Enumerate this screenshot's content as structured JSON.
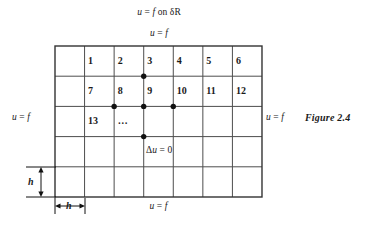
{
  "figure": {
    "caption": "Figure  2.4",
    "labels": {
      "top_outer": "u = f on δR",
      "top_inner": "u = f",
      "bottom": "u = f",
      "left": "u = f",
      "right": "u = f",
      "interior": "Δu = 0"
    },
    "dimensions": {
      "vertical_step": "h",
      "horizontal_step": "h"
    },
    "grid": {
      "columns": 7,
      "rows": 5,
      "left": 55,
      "top": 46,
      "cell_width": 29.57,
      "cell_height": 30.2,
      "line_color": "#4d4d4d",
      "border_color": "#333333"
    },
    "node_numbers": [
      {
        "label": "1",
        "col": 1,
        "row": 0
      },
      {
        "label": "2",
        "col": 2,
        "row": 0
      },
      {
        "label": "3",
        "col": 3,
        "row": 0
      },
      {
        "label": "4",
        "col": 4,
        "row": 0
      },
      {
        "label": "5",
        "col": 5,
        "row": 0
      },
      {
        "label": "6",
        "col": 6,
        "row": 0
      },
      {
        "label": "7",
        "col": 1,
        "row": 1
      },
      {
        "label": "8",
        "col": 2,
        "row": 1
      },
      {
        "label": "9",
        "col": 3,
        "row": 1
      },
      {
        "label": "10",
        "col": 4,
        "row": 1
      },
      {
        "label": "11",
        "col": 5,
        "row": 1
      },
      {
        "label": "12",
        "col": 6,
        "row": 1
      },
      {
        "label": "13",
        "col": 1,
        "row": 2
      },
      {
        "label": "…",
        "col": 2,
        "row": 2
      }
    ],
    "stencil_nodes": [
      {
        "name": "stencil-node-north",
        "col": 3,
        "row": 1
      },
      {
        "name": "stencil-node-west",
        "col": 2,
        "row": 2
      },
      {
        "name": "stencil-node-center",
        "col": 3,
        "row": 2
      },
      {
        "name": "stencil-node-east",
        "col": 4,
        "row": 2
      },
      {
        "name": "stencil-node-south",
        "col": 3,
        "row": 3
      }
    ],
    "dot_radius": 2.7,
    "dot_color": "#111111"
  }
}
